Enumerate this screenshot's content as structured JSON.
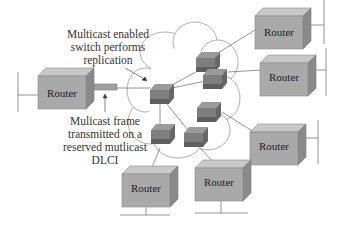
{
  "annotations": {
    "switch_note": [
      "Multicast enabled",
      "switch performs",
      "replication"
    ],
    "frame_note": [
      "Mulicast frame",
      "transmitted on a",
      "reserved mutlicast",
      "DLCI"
    ]
  },
  "routers": [
    {
      "id": "router-left",
      "label": "Router"
    },
    {
      "id": "router-top-right",
      "label": "Router"
    },
    {
      "id": "router-right-upper",
      "label": "Router"
    },
    {
      "id": "router-right-lower",
      "label": "Router"
    },
    {
      "id": "router-bottom-center",
      "label": "Router"
    },
    {
      "id": "router-bottom-left",
      "label": "Router"
    }
  ],
  "colors": {
    "router_front": "#a9a9a9",
    "router_top": "#c8c8c8",
    "router_side": "#8a8a8a",
    "switch_top": "#8c8c8c",
    "switch_front": "#6e6e6e",
    "line": "#7a7a7a",
    "cloud_stroke": "#9a9a9a"
  }
}
